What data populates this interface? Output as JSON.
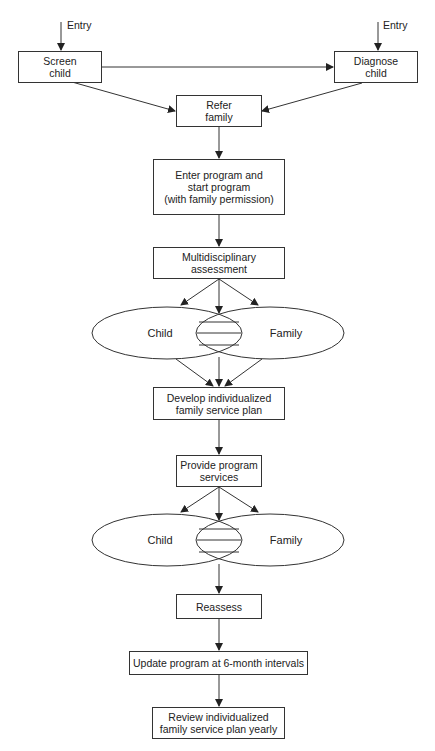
{
  "entry_label": "Entry",
  "nodes": {
    "screen_child": "Screen\nchild",
    "diagnose_child": "Diagnose\nchild",
    "refer_family": "Refer\nfamily",
    "enter_program": "Enter program and\nstart program\n(with family permission)",
    "multidisciplinary": "Multidisciplinary\nassessment",
    "develop_ifsp": "Develop individualized\nfamily service plan",
    "provide_services": "Provide program\nservices",
    "reassess": "Reassess",
    "update_program": "Update program at 6-month intervals",
    "review_ifsp": "Review individualized\nfamily service plan yearly"
  },
  "venn": [
    {
      "left": "Child",
      "right": "Family"
    },
    {
      "left": "Child",
      "right": "Family"
    }
  ],
  "colors": {
    "stroke": "#333333",
    "background": "#ffffff"
  }
}
